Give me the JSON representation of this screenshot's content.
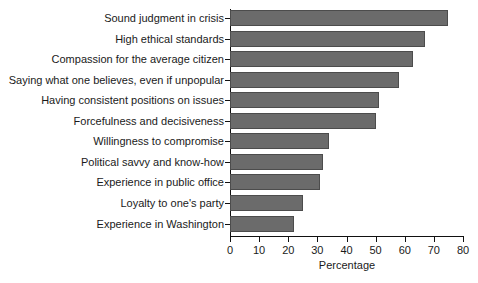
{
  "chart_data": {
    "type": "bar",
    "orientation": "horizontal",
    "title": "",
    "xlabel": "Percentage",
    "ylabel": "",
    "xlim": [
      0,
      80
    ],
    "xticks": [
      0,
      10,
      20,
      30,
      40,
      50,
      60,
      70,
      80
    ],
    "grid": false,
    "legend": null,
    "bar_color": "#6b6b6b",
    "bar_edge_color": "#4c4c4c",
    "axis_color": "#111111",
    "background_color": "#ffffff",
    "categories": [
      "Sound judgment in crisis",
      "High ethical standards",
      "Compassion for the average citizen",
      "Saying what one believes, even if unpopular",
      "Having consistent positions on issues",
      "Forcefulness and decisiveness",
      "Willingness to compromise",
      "Political savvy and know-how",
      "Experience in public office",
      "Loyalty to one's party",
      "Experience in Washington"
    ],
    "values": [
      75,
      67,
      63,
      58,
      51,
      50,
      34,
      32,
      31,
      25,
      22
    ]
  }
}
